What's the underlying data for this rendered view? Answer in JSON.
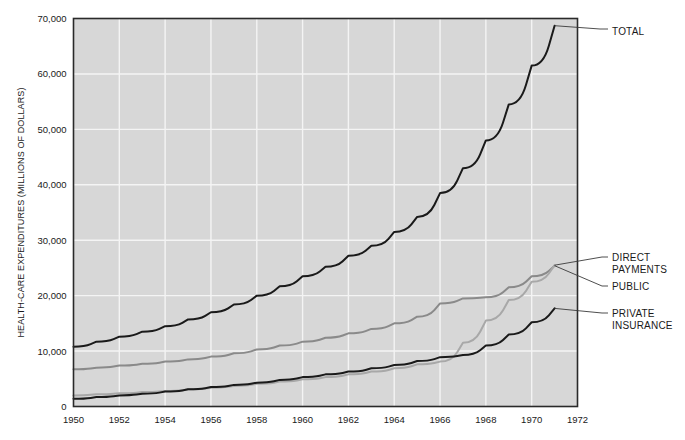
{
  "chart_data": {
    "type": "line",
    "title": "",
    "xlabel": "",
    "ylabel": "HEALTH-CARE EXPENDITURES (MILLIONS OF DOLLARS)",
    "xlim": [
      1950,
      1972
    ],
    "ylim": [
      0,
      70000
    ],
    "xticks": [
      1950,
      1952,
      1954,
      1956,
      1958,
      1960,
      1962,
      1964,
      1966,
      1968,
      1970,
      1972
    ],
    "yticks": [
      0,
      10000,
      20000,
      30000,
      40000,
      50000,
      60000,
      70000
    ],
    "ytick_labels": [
      "0",
      "10,000",
      "20,000",
      "30,000",
      "40,000",
      "50,000",
      "60,000",
      "70,000"
    ],
    "grid": true,
    "grid_color": "#f2f2f2",
    "plot_background": "#d7d7d7",
    "legend": "callout-labels-right",
    "x": [
      1950,
      1951,
      1952,
      1953,
      1954,
      1955,
      1956,
      1957,
      1958,
      1959,
      1960,
      1961,
      1962,
      1963,
      1964,
      1965,
      1966,
      1967,
      1968,
      1969,
      1970,
      1971
    ],
    "series": [
      {
        "name": "TOTAL",
        "label": "TOTAL",
        "color": "#1a1a1a",
        "width": 2.0,
        "values": [
          10800,
          11700,
          12600,
          13500,
          14500,
          15700,
          17000,
          18400,
          20000,
          21700,
          23500,
          25200,
          27200,
          29000,
          31500,
          34200,
          38500,
          43000,
          48000,
          54500,
          61500,
          68700
        ]
      },
      {
        "name": "PUBLIC",
        "label": "PUBLIC",
        "color": "#8a8a8a",
        "width": 2.0,
        "values": [
          6700,
          7000,
          7400,
          7700,
          8100,
          8500,
          9000,
          9600,
          10300,
          11000,
          11700,
          12400,
          13200,
          14000,
          15000,
          16200,
          18600,
          19500,
          19700,
          21500,
          23500,
          25400
        ]
      },
      {
        "name": "DIRECT PAYMENTS",
        "label": "DIRECT PAYMENTS",
        "color": "#a8a8a8",
        "width": 2.0,
        "values": [
          2000,
          2200,
          2400,
          2600,
          2800,
          3100,
          3400,
          3700,
          4100,
          4500,
          4900,
          5300,
          5800,
          6300,
          6900,
          7600,
          8100,
          11500,
          15500,
          19200,
          22500,
          25500
        ]
      },
      {
        "name": "PRIVATE INSURANCE",
        "label": "PRIVATE INSURANCE",
        "color": "#1a1a1a",
        "width": 2.0,
        "values": [
          1400,
          1700,
          2000,
          2300,
          2700,
          3100,
          3500,
          3900,
          4300,
          4800,
          5300,
          5800,
          6300,
          6900,
          7500,
          8200,
          8900,
          9300,
          11000,
          13000,
          15200,
          17700
        ]
      }
    ],
    "callouts": [
      {
        "label": "TOTAL",
        "lines": [
          "TOTAL"
        ]
      },
      {
        "label": "DIRECT PAYMENTS",
        "lines": [
          "DIRECT",
          "PAYMENTS"
        ]
      },
      {
        "label": "PUBLIC",
        "lines": [
          "PUBLIC"
        ]
      },
      {
        "label": "PRIVATE INSURANCE",
        "lines": [
          "PRIVATE",
          "INSURANCE"
        ]
      }
    ]
  }
}
